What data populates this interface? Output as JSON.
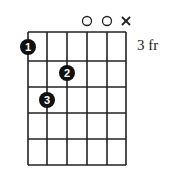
{
  "diagram": {
    "type": "guitar-chord-diagram",
    "fret_label": "3 fr",
    "strings": 6,
    "frets": 5,
    "string_markers": [
      "",
      "",
      "",
      "o",
      "o",
      "x"
    ],
    "fingers": [
      {
        "finger": "1",
        "string": 1,
        "fret": 1
      },
      {
        "finger": "2",
        "string": 3,
        "fret": 2
      },
      {
        "finger": "3",
        "string": 2,
        "fret": 3
      }
    ],
    "colors": {
      "line": "#222222",
      "dot": "#111111",
      "dot_text": "#ffffff"
    }
  }
}
